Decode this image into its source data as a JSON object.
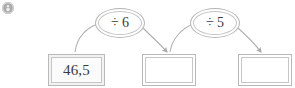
{
  "canvas": {
    "width": 295,
    "height": 88,
    "background": "#ffffff"
  },
  "badge": {
    "icon": "circle-badge-icon",
    "color": "#a8a8a8"
  },
  "diagram": {
    "type": "operator-flow-chain",
    "stroke_color": "#b9b9b9",
    "text_color": "#3a3a3a",
    "nodes": [
      {
        "id": "box1",
        "kind": "box",
        "value": "46,5",
        "filled": true
      },
      {
        "id": "op1",
        "kind": "ellipse",
        "value": "÷ 6"
      },
      {
        "id": "box2",
        "kind": "box",
        "value": "",
        "filled": false
      },
      {
        "id": "op2",
        "kind": "ellipse",
        "value": "÷ 5"
      },
      {
        "id": "box3",
        "kind": "box",
        "value": "",
        "filled": false
      }
    ],
    "edges": [
      {
        "from": "box1",
        "to": "op1",
        "arrowhead": false
      },
      {
        "from": "op1",
        "to": "box2",
        "arrowhead": true
      },
      {
        "from": "box2",
        "to": "op2",
        "arrowhead": false
      },
      {
        "from": "op2",
        "to": "box3",
        "arrowhead": true
      }
    ]
  }
}
